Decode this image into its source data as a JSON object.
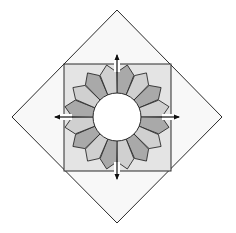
{
  "diagram": {
    "colors": {
      "page_bg": "#ffffff",
      "diamond_fill": "#f8f8f8",
      "square_fill": "#e4e4e4",
      "petal_dark": "#a9a9a9",
      "petal_light": "#d0d0d0",
      "center_fill": "#ffffff",
      "stroke": "#2a2a2a",
      "arrow": "#111111"
    },
    "geometry": {
      "center": [
        117,
        117
      ],
      "diamond": {
        "top": [
          117,
          10
        ],
        "right": [
          222,
          117
        ],
        "bottom": [
          117,
          223
        ],
        "left": [
          12,
          117
        ]
      },
      "square": {
        "x": 64,
        "y": 64,
        "size": 107
      },
      "center_circle_radius": 24,
      "petal_count": 16,
      "petal_shoulder_radius": 45,
      "petal_tip_radius": 53,
      "first_petal_shade": "dark"
    },
    "arrows": [
      {
        "name": "arrow-up",
        "direction": "up",
        "from": [
          117,
          72
        ],
        "to": [
          117,
          55
        ]
      },
      {
        "name": "arrow-right",
        "direction": "right",
        "from": [
          162,
          117
        ],
        "to": [
          179,
          117
        ]
      },
      {
        "name": "arrow-down",
        "direction": "down",
        "from": [
          117,
          162
        ],
        "to": [
          117,
          179
        ]
      },
      {
        "name": "arrow-left",
        "direction": "left",
        "from": [
          72,
          117
        ],
        "to": [
          55,
          117
        ]
      }
    ]
  }
}
